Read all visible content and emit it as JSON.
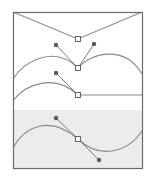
{
  "diagram": {
    "frame": {
      "x": 13,
      "y": 12,
      "width": 129,
      "height": 156,
      "stroke": "#6a6a6a"
    },
    "shaded_region": {
      "x": 13,
      "y": 110,
      "width": 129,
      "height": 58,
      "fill": "#ececec"
    },
    "colors": {
      "path": "#8a8a8a",
      "handle_line": "#7a7a7a",
      "handle_dot": "#5a5a5a",
      "anchor_fill": "#ffffff",
      "anchor_stroke": "#555555"
    },
    "examples": [
      {
        "name": "corner-point-straight",
        "anchor": {
          "x": 78,
          "y": 39
        },
        "handles": [],
        "path": "M13,12 L78,39 L142,12"
      },
      {
        "name": "corner-point-curves",
        "anchor": {
          "x": 78,
          "y": 68
        },
        "handles": [
          {
            "x": 56,
            "y": 45
          },
          {
            "x": 94,
            "y": 44
          }
        ],
        "path": "M13,79 C25,60 55,45 78,68 C92,52 125,45 142,74"
      },
      {
        "name": "curve-to-straight",
        "anchor": {
          "x": 78,
          "y": 95
        },
        "handles": [
          {
            "x": 56,
            "y": 73
          }
        ],
        "path": "M13,101 C25,84 55,73 78,95 L142,95"
      },
      {
        "name": "smooth-point",
        "anchor": {
          "x": 78,
          "y": 139
        },
        "handles": [
          {
            "x": 56,
            "y": 118
          },
          {
            "x": 99,
            "y": 160
          }
        ],
        "path": "M13,148 C25,126 50,115 78,139 C100,160 128,152 142,131"
      }
    ]
  }
}
